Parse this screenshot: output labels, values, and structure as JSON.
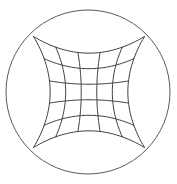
{
  "figure": {
    "type": "geometric-diagram",
    "background_color": "#ffffff",
    "canvas": {
      "width": 177,
      "height": 184
    }
  },
  "circle": {
    "name": "bounding-circle",
    "center_x": 88,
    "center_y": 92,
    "radius": 82,
    "stroke_color": "#5a5a5a",
    "stroke_width": 1,
    "fill": "none"
  },
  "grid": {
    "name": "distorted-grid",
    "rows": 5,
    "columns": 5,
    "vertical_line_count": 6,
    "horizontal_line_count": 6,
    "stroke_color": "#3f3f3f",
    "stroke_width": 1,
    "distortion": "barrel",
    "distortion_amount": 0.3,
    "corners": {
      "top_left": [
        34,
        36
      ],
      "top_right": [
        145,
        37
      ],
      "bottom_right": [
        145,
        148
      ],
      "bottom_left": [
        34,
        148
      ]
    },
    "half_span": 55.5,
    "center_x": 89,
    "center_y": 92,
    "normalized_ticks": [
      -1,
      -0.6,
      -0.2,
      0.2,
      0.6,
      1
    ]
  },
  "chart_data": {
    "type": "line",
    "xlabel": "",
    "ylabel": "",
    "xlim": [
      -1,
      1
    ],
    "ylim": [
      -1,
      1
    ],
    "grid": true,
    "legend": "none",
    "categories": [
      "u = -1.0",
      "u = -0.6",
      "u = -0.2",
      "u = 0.2",
      "u = 0.6",
      "u = 1.0"
    ],
    "series": [
      {
        "name": "vertical-line-1",
        "values": [
          -1,
          -0.6,
          -0.2,
          0.2,
          0.6,
          1
        ]
      },
      {
        "name": "vertical-line-2",
        "values": [
          -0.6,
          -0.6,
          -0.6,
          -0.6,
          -0.6,
          -0.6
        ]
      },
      {
        "name": "vertical-line-3",
        "values": [
          -0.2,
          -0.2,
          -0.2,
          -0.2,
          -0.2,
          -0.2
        ]
      },
      {
        "name": "vertical-line-4",
        "values": [
          0.2,
          0.2,
          0.2,
          0.2,
          0.2,
          0.2
        ]
      },
      {
        "name": "vertical-line-5",
        "values": [
          0.6,
          0.6,
          0.6,
          0.6,
          0.6,
          0.6
        ]
      },
      {
        "name": "vertical-line-6",
        "values": [
          1,
          0.6,
          0.2,
          -0.2,
          -0.6,
          -1
        ]
      }
    ],
    "annotations": [
      "grid corners touch the circle",
      "grid edges bow inward"
    ]
  }
}
